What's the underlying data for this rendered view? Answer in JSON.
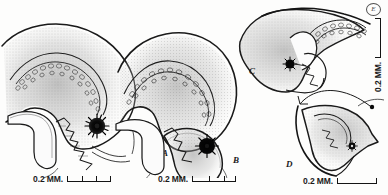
{
  "plate": {
    "title": "Anatomical illustration plate",
    "background_color": "#fdfdfc",
    "ink_color": "#1a1a1a",
    "stipple_color": "#6b6b6b",
    "pigment_spot_color": "#050505"
  },
  "panels": [
    {
      "id": "A",
      "label": "A",
      "label_x": 162,
      "label_y": 152
    },
    {
      "id": "B",
      "label": "B",
      "label_x": 233,
      "label_y": 159
    },
    {
      "id": "C",
      "label": "C",
      "label_x": 249,
      "label_y": 70
    },
    {
      "id": "D",
      "label": "D",
      "label_x": 286,
      "label_y": 163
    }
  ],
  "scale_bars": [
    {
      "id": "scale-a",
      "text": "0.2 MM.",
      "orientation": "horizontal",
      "x": 33,
      "y": 175,
      "bar_length": 44,
      "ticks": 2
    },
    {
      "id": "scale-b",
      "text": "0.2 MM.",
      "orientation": "horizontal",
      "x": 158,
      "y": 175,
      "bar_length": 44,
      "ticks": 2
    },
    {
      "id": "scale-c",
      "text": "0.2 MM.",
      "orientation": "vertical",
      "x": 372,
      "y": 92,
      "bar_length": 40,
      "ticks": 0
    },
    {
      "id": "scale-d",
      "text": "0.2 MM.",
      "orientation": "horizontal",
      "x": 303,
      "y": 177,
      "bar_length": 40,
      "ticks": 0
    }
  ],
  "corner_mark": {
    "text": "E",
    "x": 366,
    "y": 4
  }
}
